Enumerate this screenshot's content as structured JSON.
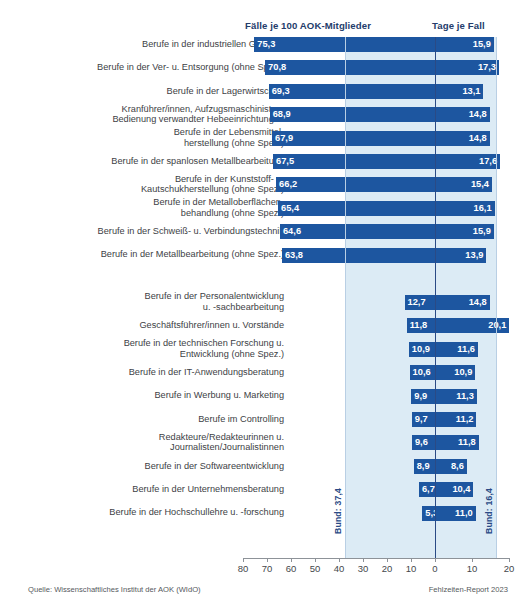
{
  "header": {
    "left_title": "Fälle je 100 AOK-Mitglieder",
    "right_title": "Tage je Fall"
  },
  "footer": {
    "source": "Quelle: Wissenschaftliches Institut der AOK (WIdO)",
    "report": "Fehlzeiten-Report 2023"
  },
  "annotations": {
    "bund_left": "Bund: 37,4",
    "bund_right": "Bund: 16,4"
  },
  "chart_data": {
    "type": "bar",
    "title": "",
    "subtitle": "",
    "orientation": "horizontal",
    "layout": "diverging-paired",
    "xlabel_left": "Fälle je 100 AOK-Mitglieder",
    "xlabel_right": "Tage je Fall",
    "ylabel": "",
    "grid": false,
    "legend": "none",
    "axis_ticks": [
      80,
      70,
      60,
      50,
      40,
      30,
      20,
      10,
      0,
      10,
      20
    ],
    "axis_tick_labels": [
      "80",
      "70",
      "60",
      "50",
      "40",
      "30",
      "20",
      "10",
      "0",
      "10",
      "20"
    ],
    "xlim_left": [
      0,
      80
    ],
    "xlim_right": [
      0,
      25
    ],
    "reference_lines": {
      "bund_faelle": 37.4,
      "bund_tage": 16.4
    },
    "series": [
      {
        "name": "Fälle je 100 AOK-Mitglieder",
        "values": [
          75.3,
          70.8,
          69.3,
          68.9,
          67.9,
          67.5,
          66.2,
          65.4,
          64.6,
          63.8,
          12.7,
          11.8,
          10.9,
          10.6,
          9.9,
          9.7,
          9.6,
          8.9,
          6.7,
          5.3
        ]
      },
      {
        "name": "Tage je Fall",
        "values": [
          15.9,
          17.3,
          13.1,
          14.8,
          14.8,
          17.6,
          15.4,
          16.1,
          15.9,
          13.9,
          14.8,
          20.1,
          11.6,
          10.9,
          11.3,
          11.2,
          11.8,
          8.6,
          10.4,
          11.0
        ]
      }
    ],
    "categories": [
      "Berufe in der industriellen Gießerei",
      "Berufe in der Ver- u. Entsorgung (ohne Spez.)",
      "Berufe in der Lagerwirtschaft",
      "Kranführer/innen, Aufzugsmaschinisten,\nBedienung verwandter Hebeeinrichtungen",
      "Berufe in der Lebensmittel-\nherstellung (ohne Spez.)",
      "Berufe in der spanlosen Metallbearbeitung",
      "Berufe in der Kunststoff- u.\nKautschukherstellung (ohne Spez.)",
      "Berufe in der Metalloberflächen-\nbehandlung (ohne Spez.)",
      "Berufe in der Schweiß- u. Verbindungstechnik",
      "Berufe in der Metallbearbeitung (ohne Spez.)",
      "Berufe in der Personalentwicklung\nu. -sachbearbeitung",
      "Geschäftsführer/innen u. Vorstände",
      "Berufe in der technischen Forschung u.\nEntwicklung (ohne Spez.)",
      "Berufe in der IT-Anwendungsberatung",
      "Berufe in Werbung u. Marketing",
      "Berufe im Controlling",
      "Redakteure/Redakteurinnen u.\nJournalisten/Journalistinnen",
      "Berufe in der Softwareentwicklung",
      "Berufe in der Unternehmensberatung",
      "Berufe in der Hochschullehre u. -forschung"
    ],
    "value_labels_left": [
      "75,3",
      "70,8",
      "69,3",
      "68,9",
      "67,9",
      "67,5",
      "66,2",
      "65,4",
      "64,6",
      "63,8",
      "12,7",
      "11,8",
      "10,9",
      "10,6",
      "9,9",
      "9,7",
      "9,6",
      "8,9",
      "6,7",
      "5,3"
    ],
    "value_labels_right": [
      "15,9",
      "17,3",
      "13,1",
      "14,8",
      "14,8",
      "17,6",
      "15,4",
      "16,1",
      "15,9",
      "13,9",
      "14,8",
      "20,1",
      "11,6",
      "10,9",
      "11,3",
      "11,2",
      "11,8",
      "8,6",
      "10,4",
      "11,0"
    ],
    "group_break_after_index": 9,
    "colors": {
      "bar": "#1d56a0",
      "band": "#dcebf5",
      "zeroline": "#2a4a85",
      "header_text": "#243c6b",
      "label_text": "#3d4145"
    }
  }
}
